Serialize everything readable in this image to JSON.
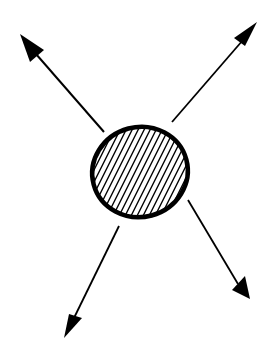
{
  "diagram": {
    "description": "Hand-drawn sketch: a hatched circle in the center with four arrows radiating outward diagonally",
    "ink_color": "#000000",
    "background": "#ffffff",
    "center_shape": {
      "type": "hatched-circle",
      "cx": 140,
      "cy": 172,
      "rx": 50,
      "ry": 47,
      "hatch": "diagonal lines"
    },
    "arrows": [
      {
        "name": "up-left",
        "from": [
          104,
          132
        ],
        "to": [
          22,
          36
        ]
      },
      {
        "name": "up-right",
        "from": [
          172,
          122
        ],
        "to": [
          257,
          22
        ]
      },
      {
        "name": "down-left",
        "from": [
          119,
          226
        ],
        "to": [
          65,
          337
        ]
      },
      {
        "name": "down-right",
        "from": [
          188,
          200
        ],
        "to": [
          247,
          299
        ]
      }
    ]
  }
}
